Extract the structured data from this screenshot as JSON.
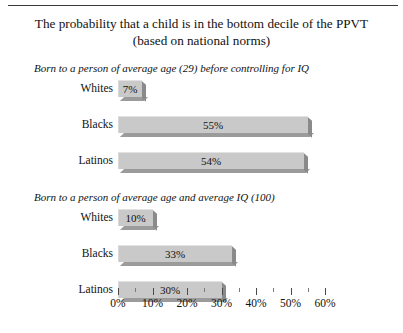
{
  "chart_data": {
    "type": "bar",
    "orientation": "horizontal",
    "title": "The probability that a child is in the bottom decile of the PPVT (based on national norms)",
    "title_lines": [
      "The probability that a child is in the bottom decile of the PPVT",
      "(based on national norms)"
    ],
    "xlabel": "",
    "ylabel": "",
    "xlim": [
      0,
      65
    ],
    "grid": false,
    "legend": "none",
    "axis": {
      "tick_labels": [
        "0%",
        "10%",
        "20%",
        "30%",
        "40%",
        "50%",
        "60%"
      ],
      "tick_values": [
        0,
        10,
        20,
        30,
        40,
        50,
        60
      ],
      "minor_tick_values": [
        5,
        15,
        25,
        35,
        45,
        55
      ],
      "unit": "%"
    },
    "panels": [
      {
        "subtitle": "Born to a person of average age (29) before controlling for IQ",
        "categories": [
          "Whites",
          "Blacks",
          "Latinos"
        ],
        "values": [
          7,
          55,
          54
        ],
        "value_labels": [
          "7%",
          "55%",
          "54%"
        ]
      },
      {
        "subtitle": "Born to a person of average age and average IQ (100)",
        "categories": [
          "Whites",
          "Blacks",
          "Latinos"
        ],
        "values": [
          10,
          33,
          30
        ],
        "value_labels": [
          "10%",
          "33%",
          "30%"
        ]
      }
    ],
    "colors": {
      "bar_face": "#c9c9c9",
      "bar_side": "#8a8a8a",
      "bar_bottom": "#9b9b9b",
      "text": "#111111",
      "background": "#ffffff",
      "rule": "#3a3a3a"
    }
  }
}
